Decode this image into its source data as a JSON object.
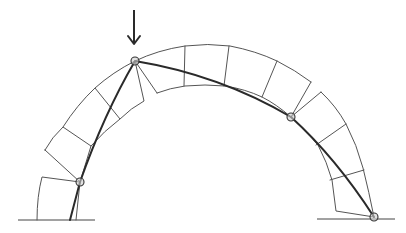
{
  "figure": {
    "colors": {
      "background": "#ffffff",
      "block_outline": "#555555",
      "thrust_line": "#2a2a2a",
      "hinge_fill": "#cfcfcf"
    },
    "load_arrow": {
      "label": "",
      "direction": "down",
      "x": 134,
      "y_top": 10,
      "y_tip": 45
    },
    "hinges": [
      {
        "id": "left-support-hinge",
        "x": 80,
        "y": 182
      },
      {
        "id": "crown-load-hinge",
        "x": 135,
        "y": 61
      },
      {
        "id": "right-haunch-hinge",
        "x": 291,
        "y": 117
      },
      {
        "id": "right-support-hinge",
        "x": 374,
        "y": 217
      }
    ],
    "ground_lines": [
      {
        "id": "left-ground",
        "x1": 18,
        "x2": 95,
        "y": 220
      },
      {
        "id": "right-ground",
        "x1": 317,
        "x2": 395,
        "y": 219
      }
    ],
    "text_labels": []
  }
}
